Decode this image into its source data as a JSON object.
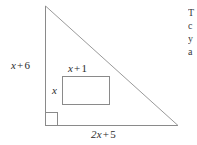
{
  "figure": {
    "type": "geometry-diagram",
    "background_color": "#ffffff",
    "line_color": "#8a8a8a",
    "text_color": "#2b2b2b",
    "triangle": {
      "name": "right-triangle",
      "apex": {
        "x": 45,
        "y": 6
      },
      "bottom_left": {
        "x": 45,
        "y": 125
      },
      "bottom_right": {
        "x": 178,
        "y": 125
      },
      "right_angle_at": "bottom-left",
      "right_angle_marker_size": 12
    },
    "rectangle": {
      "name": "inscribed-rectangle",
      "left": 62,
      "top": 76,
      "right": 110,
      "bottom": 105
    },
    "labels": {
      "vertical_side": {
        "variable": "x",
        "operator": "+",
        "constant": "6",
        "full": "x + 6"
      },
      "rect_width": {
        "variable": "x",
        "operator": "+",
        "constant": "1",
        "full": "x + 1"
      },
      "rect_height": {
        "variable": "x",
        "operator": "",
        "constant": "",
        "full": "x"
      },
      "base": {
        "variable": "2x",
        "operator": "+",
        "constant": "5",
        "full": "2x + 5"
      }
    }
  },
  "side_text": {
    "name": "cropped-problem-text",
    "lines": [
      "T",
      "c",
      "y",
      "a"
    ]
  }
}
